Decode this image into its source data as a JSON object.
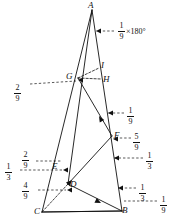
{
  "figure": {
    "type": "geometry-diagram",
    "vertices": [
      {
        "name": "A",
        "label": "A",
        "x": 92,
        "y": 10
      },
      {
        "name": "B",
        "label": "B",
        "x": 122,
        "y": 211
      },
      {
        "name": "C",
        "label": "C",
        "x": 42,
        "y": 212
      },
      {
        "name": "D",
        "label": "D",
        "x": 68,
        "y": 184
      },
      {
        "name": "E",
        "label": "E",
        "x": 62,
        "y": 168
      },
      {
        "name": "F",
        "label": "F",
        "x": 112,
        "y": 136
      },
      {
        "name": "G",
        "label": "G",
        "x": 78,
        "y": 78
      },
      {
        "name": "H",
        "label": "H",
        "x": 101,
        "y": 79
      },
      {
        "name": "I",
        "label": "I",
        "x": 99,
        "y": 68
      }
    ],
    "vertex_labels": [
      {
        "name": "vertex-label-A",
        "text": "A",
        "x": 88,
        "y": 1
      },
      {
        "name": "vertex-label-I",
        "text": "I",
        "x": 101,
        "y": 61
      },
      {
        "name": "vertex-label-G",
        "text": "G",
        "x": 66,
        "y": 72
      },
      {
        "name": "vertex-label-H",
        "text": "H",
        "x": 103,
        "y": 75
      },
      {
        "name": "vertex-label-F",
        "text": "F",
        "x": 114,
        "y": 131
      },
      {
        "name": "vertex-label-E",
        "text": "E",
        "x": 52,
        "y": 162
      },
      {
        "name": "vertex-label-D",
        "text": "D",
        "x": 70,
        "y": 180
      },
      {
        "name": "vertex-label-C",
        "text": "C",
        "x": 34,
        "y": 207
      },
      {
        "name": "vertex-label-B",
        "text": "B",
        "x": 122,
        "y": 206
      }
    ],
    "labels": [
      {
        "name": "ratio-label-1-9-times-180",
        "num": "1",
        "den": "9",
        "suffix": "×180°",
        "x": 118,
        "y": 22
      },
      {
        "name": "ratio-label-2-9-left-G",
        "num": "2",
        "den": "9",
        "suffix": "",
        "x": 14,
        "y": 84
      },
      {
        "name": "ratio-label-1-9-right-upper",
        "num": "1",
        "den": "9",
        "suffix": "",
        "x": 127,
        "y": 107
      },
      {
        "name": "ratio-label-5-9-right-F",
        "num": "5",
        "den": "9",
        "suffix": "",
        "x": 133,
        "y": 133
      },
      {
        "name": "ratio-label-1-3-right-mid",
        "num": "1",
        "den": "3",
        "suffix": "",
        "x": 146,
        "y": 152
      },
      {
        "name": "ratio-label-2-9-left-E",
        "num": "2",
        "den": "9",
        "suffix": "",
        "x": 22,
        "y": 151
      },
      {
        "name": "ratio-label-1-3-left-E",
        "num": "1",
        "den": "3",
        "suffix": "",
        "x": 5,
        "y": 163
      },
      {
        "name": "ratio-label-4-9-left-D",
        "num": "4",
        "den": "9",
        "suffix": "",
        "x": 22,
        "y": 182
      },
      {
        "name": "ratio-label-1-3-right-B",
        "num": "1",
        "den": "3",
        "suffix": "",
        "x": 139,
        "y": 184
      },
      {
        "name": "ratio-label-1-9-right-B",
        "num": "1",
        "den": "9",
        "suffix": "",
        "x": 160,
        "y": 196
      }
    ],
    "solid_segments": [
      {
        "name": "side-A-C",
        "x1": 92,
        "y1": 10,
        "x2": 42,
        "y2": 212
      },
      {
        "name": "side-A-B",
        "x1": 92,
        "y1": 10,
        "x2": 122,
        "y2": 211
      },
      {
        "name": "side-C-B",
        "x1": 42,
        "y1": 212,
        "x2": 122,
        "y2": 211
      },
      {
        "name": "cevian-A-D",
        "x1": 92,
        "y1": 10,
        "x2": 68,
        "y2": 184
      },
      {
        "name": "cevian-G-F",
        "x1": 78,
        "y1": 78,
        "x2": 112,
        "y2": 136
      },
      {
        "name": "cevian-F-D",
        "x1": 112,
        "y1": 136,
        "x2": 68,
        "y2": 184
      },
      {
        "name": "cevian-D-B",
        "x1": 68,
        "y1": 184,
        "x2": 122,
        "y2": 211
      },
      {
        "name": "cevian-C-B-low",
        "x1": 42,
        "y1": 212,
        "x2": 122,
        "y2": 211
      }
    ],
    "dashed_segments": [
      {
        "name": "dash-G-H",
        "x1": 78,
        "y1": 78,
        "x2": 101,
        "y2": 79
      },
      {
        "name": "dash-G-I",
        "x1": 78,
        "y1": 78,
        "x2": 99,
        "y2": 68
      },
      {
        "name": "dash-C-D",
        "x1": 42,
        "y1": 212,
        "x2": 68,
        "y2": 184
      }
    ],
    "leader_lines": [
      {
        "name": "leader-1-9-180",
        "x1": 114,
        "y1": 31,
        "x2": 96,
        "y2": 31
      },
      {
        "name": "leader-2-9-G",
        "x1": 30,
        "y1": 84,
        "x2": 76,
        "y2": 81
      },
      {
        "name": "leader-1-9-upper",
        "x1": 124,
        "y1": 113,
        "x2": 108,
        "y2": 113
      },
      {
        "name": "leader-5-9-F",
        "x1": 131,
        "y1": 138,
        "x2": 113,
        "y2": 138
      },
      {
        "name": "leader-1-3-mid",
        "x1": 143,
        "y1": 158,
        "x2": 114,
        "y2": 158
      },
      {
        "name": "leader-2-9-E",
        "x1": 36,
        "y1": 161,
        "x2": 62,
        "y2": 161
      },
      {
        "name": "leader-1-3-E",
        "x1": 20,
        "y1": 170,
        "x2": 63,
        "y2": 170
      },
      {
        "name": "leader-4-9-D",
        "x1": 38,
        "y1": 190,
        "x2": 66,
        "y2": 190
      },
      {
        "name": "leader-1-3-B",
        "x1": 136,
        "y1": 188,
        "x2": 118,
        "y2": 188
      },
      {
        "name": "leader-1-9-B",
        "x1": 157,
        "y1": 201,
        "x2": 124,
        "y2": 201
      }
    ],
    "arrow_markers": [
      {
        "name": "arrow-AB-upper",
        "x": 96,
        "y": 31
      },
      {
        "name": "arrow-G",
        "x": 78,
        "y": 80
      },
      {
        "name": "arrow-AB-mid",
        "x": 108,
        "y": 113
      },
      {
        "name": "arrow-F-right",
        "x": 113,
        "y": 139
      },
      {
        "name": "arrow-AB-low",
        "x": 114,
        "y": 158
      },
      {
        "name": "arrow-E",
        "x": 63,
        "y": 170
      },
      {
        "name": "arrow-D",
        "x": 67,
        "y": 190
      },
      {
        "name": "arrow-B-right",
        "x": 118,
        "y": 188
      }
    ],
    "path_arrows": [
      {
        "name": "arrow-head-F-to-D",
        "x": 72,
        "y": 180,
        "angle": 133
      },
      {
        "name": "arrow-head-B-to-C",
        "x": 101,
        "y": 203,
        "angle": 206
      },
      {
        "name": "arrow-head-G-to-F",
        "x": 99,
        "y": 116,
        "angle": 60
      }
    ],
    "colors": {
      "ink": "#111111",
      "background": "#ffffff"
    }
  }
}
